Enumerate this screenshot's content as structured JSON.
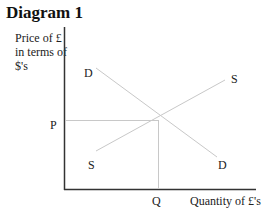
{
  "title": "Diagram 1",
  "axes": {
    "y_label": "Price of £\nin terms of\n$'s",
    "x_label": "Quantity of £'s"
  },
  "curves": {
    "demand_top_label": "D",
    "demand_bottom_label": "D",
    "supply_top_label": "S",
    "supply_bottom_label": "S"
  },
  "equilibrium": {
    "price_label": "P",
    "quantity_label": "Q"
  },
  "colors": {
    "axis": "#333333",
    "curve": "#c8c8c8",
    "guide": "#c8c8c8"
  }
}
